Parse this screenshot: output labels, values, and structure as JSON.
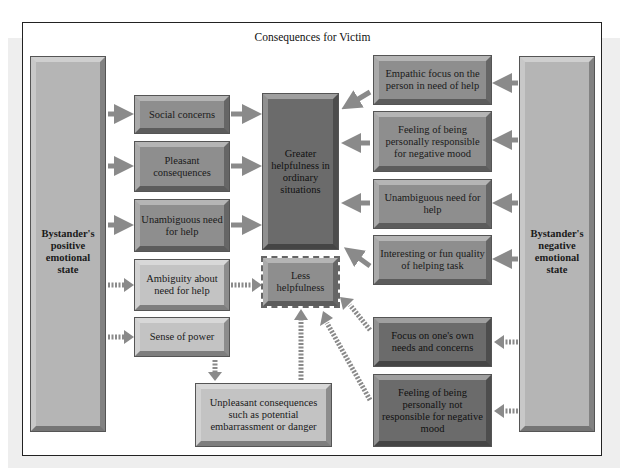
{
  "title": "Consequences for Victim",
  "left_source": "Bystander's positive emotional state",
  "right_source": "Bystander's negative emotional state",
  "left_mediators": [
    {
      "label": "Social concerns",
      "arrow": "solid"
    },
    {
      "label": "Pleasant consequences",
      "arrow": "solid"
    },
    {
      "label": "Unambiguous need for help",
      "arrow": "solid"
    },
    {
      "label": "Ambiguity about need for help",
      "arrow": "dotted"
    },
    {
      "label": "Sense of power",
      "arrow": "dotted"
    }
  ],
  "outcomes": {
    "greater": "Greater helpfulness in ordinary situations",
    "less": "Less helpfulness"
  },
  "unpleasant": "Unpleasant consequences such as potential embarrassment or danger",
  "right_mediators": [
    {
      "label": "Empathic focus on the person in need of help",
      "arrow": "solid"
    },
    {
      "label": "Feeling of being personally responsible for negative mood",
      "arrow": "solid"
    },
    {
      "label": "Unambiguous need for help",
      "arrow": "solid"
    },
    {
      "label": "Interesting or fun quality of helping task",
      "arrow": "solid"
    },
    {
      "label": "Focus on one's own needs and concerns",
      "arrow": "dotted"
    },
    {
      "label": "Feeling of being personally not responsible for negative mood",
      "arrow": "dotted"
    }
  ],
  "colors": {
    "arrow": "#8a8a8a",
    "source_box": "#b5b5b5",
    "mediator_box": "#8e8e8e",
    "light_box": "#c3c3c3",
    "dark_box": "#6b6b6b"
  }
}
